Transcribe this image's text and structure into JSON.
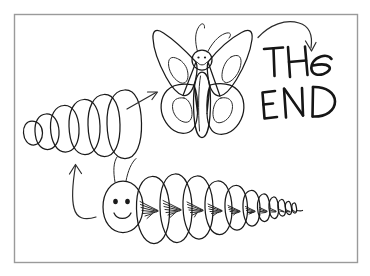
{
  "artwork": {
    "title": "THe END",
    "medium": "hand-drawn ink sketch",
    "background_color": "#ffffff",
    "ink_color": "#1a1a1a",
    "frame_color": "#9a9a9a",
    "frame": {
      "x": 14,
      "y": 14,
      "width": 343,
      "height": 248
    }
  },
  "text_blocks": [
    {
      "id": "line-1",
      "value": "THe",
      "x": 264,
      "y": 72
    },
    {
      "id": "line-2",
      "value": "END",
      "x": 262,
      "y": 110
    }
  ],
  "figures": [
    {
      "id": "caterpillar",
      "label": "caterpillar",
      "description": "smiling segmented caterpillar with two antennae and hatched body markings",
      "segment_count": 11,
      "has_face": true,
      "face": {
        "eyes": 2,
        "mouth": "smile"
      }
    },
    {
      "id": "chrysalis",
      "label": "chrysalis",
      "description": "cocoon formed of six overlapping oval segments increasing in size left to right",
      "segment_count": 6,
      "has_face": false
    },
    {
      "id": "butterfly",
      "label": "butterfly",
      "description": "smiling butterfly with four wings, long narrow body and two curled antennae",
      "wing_count": 4,
      "has_face": true,
      "face": {
        "eyes": 2,
        "mouth": "smile"
      }
    }
  ],
  "arrows": [
    {
      "id": "arrow-caterpillar-to-chrysalis",
      "from": "caterpillar",
      "to": "chrysalis",
      "style": "curved"
    },
    {
      "id": "arrow-chrysalis-to-butterfly",
      "from": "chrysalis",
      "to": "butterfly",
      "style": "straight"
    },
    {
      "id": "arrow-butterfly-to-text",
      "from": "butterfly",
      "to": "line-1",
      "style": "arc"
    }
  ]
}
